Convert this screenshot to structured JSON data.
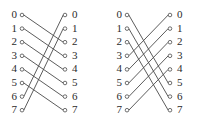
{
  "figure": {
    "type": "permutation-network-diagram",
    "terminal_count": 8,
    "wire_color": "#4a4a4a",
    "label_color": "#2b2b2b",
    "background_color": "#ffffff"
  },
  "diagrams": [
    {
      "name": "left-diagram",
      "left_labels": [
        "0",
        "1",
        "2",
        "3",
        "4",
        "5",
        "6",
        "7"
      ],
      "right_labels": [
        "0",
        "1",
        "2",
        "3",
        "4",
        "5",
        "6",
        "7"
      ],
      "connections": [
        {
          "from": 0,
          "to": 2
        },
        {
          "from": 1,
          "to": 3
        },
        {
          "from": 2,
          "to": 4
        },
        {
          "from": 3,
          "to": 5
        },
        {
          "from": 4,
          "to": 6
        },
        {
          "from": 5,
          "to": 7
        },
        {
          "from": 6,
          "to": 0
        },
        {
          "from": 7,
          "to": 1
        }
      ]
    },
    {
      "name": "right-diagram",
      "left_labels": [
        "0",
        "1",
        "2",
        "3",
        "4",
        "5",
        "6",
        "7"
      ],
      "right_labels": [
        "0",
        "1",
        "2",
        "3",
        "4",
        "5",
        "6",
        "7"
      ],
      "connections": [
        {
          "from": 0,
          "to": 5
        },
        {
          "from": 1,
          "to": 6
        },
        {
          "from": 2,
          "to": 7
        },
        {
          "from": 3,
          "to": 0
        },
        {
          "from": 4,
          "to": 1
        },
        {
          "from": 5,
          "to": 2
        },
        {
          "from": 6,
          "to": 3
        },
        {
          "from": 7,
          "to": 4
        }
      ]
    }
  ],
  "geometry": {
    "row_top": 15,
    "row_step": 13.6,
    "left_node_x": 22,
    "right_node_x": 65,
    "node_radius": 1.8,
    "left_label_x": 7,
    "right_label_x": 72
  }
}
